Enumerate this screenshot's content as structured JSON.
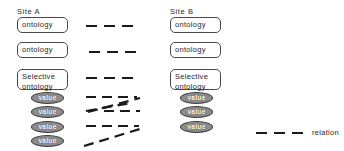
{
  "diagram": {
    "stroke_color": "#1a1a1a",
    "box_fill": "#ffffff",
    "box_border": "#4a4a4a",
    "value_fill": "#8c8c8c",
    "value_text_color": "#ffffff"
  },
  "site_a": {
    "title": "Site A",
    "boxes": [
      {
        "label": "ontology"
      },
      {
        "label": "ontology"
      },
      {
        "label": "Selective\nontology"
      }
    ],
    "values": [
      {
        "label": "value"
      },
      {
        "label": "value"
      },
      {
        "label": "value"
      },
      {
        "label": "value"
      }
    ]
  },
  "site_b": {
    "title": "Site B",
    "boxes": [
      {
        "label": "ontology"
      },
      {
        "label": "ontology"
      },
      {
        "label": "Selective\nontology"
      }
    ],
    "values": [
      {
        "label": "value"
      },
      {
        "label": "value"
      },
      {
        "label": "value"
      }
    ]
  },
  "legend": {
    "label": "relation",
    "line_style": "dashed"
  },
  "connectors": [
    {
      "name": "ontology-1-relation",
      "from": "a-box-1",
      "to": "b-box-1",
      "style": "dashed-horizontal"
    },
    {
      "name": "ontology-2-relation",
      "from": "a-box-2",
      "to": "b-box-2",
      "style": "dashed-horizontal"
    },
    {
      "name": "selective-relation",
      "from": "a-box-3",
      "to": "b-box-3",
      "style": "dashed-horizontal"
    },
    {
      "name": "value-relation-1",
      "from": "a-val-1",
      "to": "b-val-1",
      "style": "dashed-horizontal"
    },
    {
      "name": "value-relation-2",
      "from": "a-val-2",
      "to": "b-val-1",
      "style": "dashed-diagonal-up"
    },
    {
      "name": "value-relation-3",
      "from": "a-val-1",
      "to": "b-val-2",
      "style": "dashed-diagonal-down"
    },
    {
      "name": "value-relation-4",
      "from": "a-val-2",
      "to": "b-val-2",
      "style": "dashed-horizontal"
    },
    {
      "name": "value-relation-5",
      "from": "a-val-3",
      "to": "b-val-3",
      "style": "dashed-horizontal"
    },
    {
      "name": "value-relation-6",
      "from": "a-val-4",
      "to": "b-val-3",
      "style": "dashed-diagonal-up"
    }
  ]
}
